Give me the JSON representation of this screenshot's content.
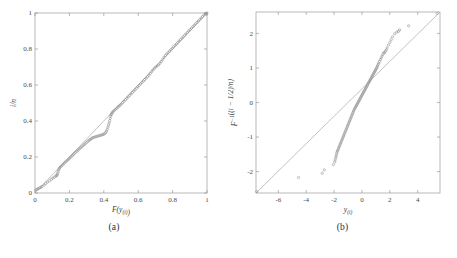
{
  "figure": {
    "background": "#ffffff",
    "line_color": "#a8a8a8",
    "marker_color": "#8c8c8c",
    "text_color": "#3a3a3a"
  },
  "panels": [
    {
      "caption": "(a)",
      "xlabel": "F(y(i))",
      "ylabel": "i/n"
    },
    {
      "caption": "(b)",
      "xlabel": "y(i)",
      "ylabel": "F −1((i − 1/2)/n)"
    }
  ],
  "chart_data": [
    {
      "type": "scatter",
      "title": "",
      "subtitle": "",
      "panel": "(a)",
      "xlabel": "F(y(i))",
      "ylabel": "i/n",
      "xlim": [
        0,
        1
      ],
      "ylim": [
        0,
        1
      ],
      "xticks": [
        0,
        0.2,
        0.4,
        0.6,
        0.8,
        1
      ],
      "xticklabels": [
        "0",
        "0.2",
        "0.4",
        "0.6",
        "0.8",
        "1"
      ],
      "yticks": [
        0,
        0.2,
        0.4,
        0.6,
        0.8,
        1
      ],
      "yticklabels": [
        "0",
        "0.2",
        "0.4",
        "0.6",
        "0.8",
        "1"
      ],
      "grid": false,
      "legend": null,
      "reference_line": {
        "from": [
          0,
          0
        ],
        "to": [
          1,
          1
        ],
        "style": "solid"
      },
      "marker": "open-circle",
      "series": [
        {
          "name": "empirical cdf vs theoretical cdf",
          "x": [
            0.005,
            0.012,
            0.018,
            0.026,
            0.034,
            0.041,
            0.052,
            0.062,
            0.072,
            0.084,
            0.095,
            0.104,
            0.113,
            0.121,
            0.126,
            0.129,
            0.131,
            0.134,
            0.138,
            0.141,
            0.145,
            0.151,
            0.158,
            0.164,
            0.17,
            0.177,
            0.184,
            0.191,
            0.197,
            0.203,
            0.21,
            0.217,
            0.223,
            0.229,
            0.236,
            0.243,
            0.25,
            0.257,
            0.264,
            0.271,
            0.278,
            0.285,
            0.292,
            0.299,
            0.306,
            0.313,
            0.319,
            0.325,
            0.331,
            0.337,
            0.344,
            0.351,
            0.358,
            0.365,
            0.372,
            0.379,
            0.386,
            0.393,
            0.399,
            0.405,
            0.411,
            0.416,
            0.42,
            0.424,
            0.428,
            0.431,
            0.434,
            0.437,
            0.44,
            0.442,
            0.445,
            0.449,
            0.454,
            0.46,
            0.467,
            0.474,
            0.481,
            0.488,
            0.495,
            0.502,
            0.51,
            0.518,
            0.526,
            0.534,
            0.542,
            0.55,
            0.558,
            0.566,
            0.574,
            0.582,
            0.59,
            0.598,
            0.606,
            0.614,
            0.622,
            0.63,
            0.638,
            0.646,
            0.654,
            0.662,
            0.67,
            0.678,
            0.686,
            0.694,
            0.702,
            0.71,
            0.718,
            0.726,
            0.734,
            0.742,
            0.75,
            0.758,
            0.766,
            0.774,
            0.782,
            0.79,
            0.798,
            0.806,
            0.814,
            0.822,
            0.83,
            0.838,
            0.846,
            0.854,
            0.862,
            0.87,
            0.878,
            0.886,
            0.894,
            0.902,
            0.91,
            0.918,
            0.926,
            0.934,
            0.942,
            0.95,
            0.958,
            0.966,
            0.974,
            0.982,
            0.99,
            0.996,
            1.0
          ],
          "y": [
            0.018,
            0.021,
            0.024,
            0.028,
            0.032,
            0.036,
            0.044,
            0.052,
            0.06,
            0.068,
            0.076,
            0.082,
            0.088,
            0.093,
            0.097,
            0.101,
            0.108,
            0.118,
            0.128,
            0.136,
            0.142,
            0.148,
            0.154,
            0.16,
            0.166,
            0.172,
            0.178,
            0.184,
            0.19,
            0.196,
            0.202,
            0.208,
            0.214,
            0.22,
            0.226,
            0.232,
            0.238,
            0.244,
            0.25,
            0.256,
            0.262,
            0.268,
            0.274,
            0.28,
            0.286,
            0.292,
            0.296,
            0.3,
            0.304,
            0.308,
            0.31,
            0.312,
            0.314,
            0.316,
            0.318,
            0.32,
            0.322,
            0.324,
            0.326,
            0.33,
            0.336,
            0.344,
            0.354,
            0.366,
            0.378,
            0.39,
            0.402,
            0.414,
            0.426,
            0.434,
            0.44,
            0.446,
            0.452,
            0.458,
            0.464,
            0.47,
            0.476,
            0.482,
            0.488,
            0.494,
            0.502,
            0.51,
            0.518,
            0.526,
            0.534,
            0.542,
            0.55,
            0.558,
            0.566,
            0.574,
            0.582,
            0.59,
            0.598,
            0.606,
            0.614,
            0.622,
            0.63,
            0.638,
            0.646,
            0.654,
            0.664,
            0.674,
            0.684,
            0.692,
            0.7,
            0.706,
            0.712,
            0.72,
            0.73,
            0.742,
            0.754,
            0.764,
            0.772,
            0.78,
            0.788,
            0.796,
            0.804,
            0.812,
            0.82,
            0.828,
            0.836,
            0.844,
            0.852,
            0.86,
            0.868,
            0.876,
            0.884,
            0.892,
            0.9,
            0.908,
            0.916,
            0.924,
            0.932,
            0.94,
            0.948,
            0.956,
            0.964,
            0.972,
            0.98,
            0.988,
            0.994,
            0.998,
            1.0
          ]
        }
      ]
    },
    {
      "type": "scatter",
      "title": "",
      "subtitle": "",
      "panel": "(b)",
      "xlabel": "y(i)",
      "ylabel": "F −1((i − 1/2)/n)",
      "xlim": [
        -7.6,
        5.6
      ],
      "ylim": [
        -2.62,
        2.62
      ],
      "xticks": [
        -6,
        -4,
        -2,
        0,
        2,
        4
      ],
      "xticklabels": [
        "-6",
        "-4",
        "-2",
        "0",
        "2",
        "4"
      ],
      "yticks": [
        -2,
        -1,
        0,
        1,
        2
      ],
      "yticklabels": [
        "-2",
        "-1",
        "0",
        "1",
        "2"
      ],
      "grid": false,
      "legend": null,
      "reference_line": {
        "from": [
          -7.6,
          -2.62
        ],
        "to": [
          5.6,
          2.62
        ],
        "style": "solid"
      },
      "marker": "open-circle",
      "series": [
        {
          "name": "normal quantile-quantile",
          "x": [
            -7.55,
            -4.55,
            -2.85,
            -2.7,
            -2.05,
            -1.95,
            -1.92,
            -1.88,
            -1.85,
            -1.82,
            -1.8,
            -1.76,
            -1.72,
            -1.68,
            -1.64,
            -1.6,
            -1.56,
            -1.52,
            -1.48,
            -1.44,
            -1.4,
            -1.36,
            -1.32,
            -1.28,
            -1.24,
            -1.2,
            -1.16,
            -1.12,
            -1.08,
            -1.04,
            -1.0,
            -0.96,
            -0.92,
            -0.88,
            -0.84,
            -0.8,
            -0.76,
            -0.72,
            -0.68,
            -0.64,
            -0.6,
            -0.56,
            -0.52,
            -0.48,
            -0.44,
            -0.4,
            -0.36,
            -0.32,
            -0.28,
            -0.24,
            -0.2,
            -0.16,
            -0.12,
            -0.08,
            -0.04,
            0.0,
            0.04,
            0.08,
            0.12,
            0.16,
            0.2,
            0.24,
            0.28,
            0.32,
            0.36,
            0.4,
            0.44,
            0.48,
            0.52,
            0.56,
            0.6,
            0.64,
            0.68,
            0.72,
            0.76,
            0.8,
            0.84,
            0.88,
            0.92,
            0.96,
            1.0,
            1.04,
            1.08,
            1.12,
            1.16,
            1.2,
            1.26,
            1.32,
            1.38,
            1.44,
            1.5,
            1.56,
            1.62,
            1.68,
            1.74,
            1.8,
            1.9,
            2.0,
            2.1,
            2.2,
            2.35,
            2.5,
            2.62,
            2.7,
            3.35,
            5.4
          ],
          "y": [
            -2.58,
            -2.17,
            -2.05,
            -1.95,
            -1.8,
            -1.72,
            -1.66,
            -1.6,
            -1.55,
            -1.5,
            -1.45,
            -1.41,
            -1.37,
            -1.33,
            -1.29,
            -1.25,
            -1.21,
            -1.17,
            -1.13,
            -1.09,
            -1.05,
            -1.01,
            -0.97,
            -0.93,
            -0.89,
            -0.85,
            -0.81,
            -0.77,
            -0.73,
            -0.69,
            -0.65,
            -0.61,
            -0.57,
            -0.53,
            -0.49,
            -0.45,
            -0.41,
            -0.37,
            -0.33,
            -0.29,
            -0.25,
            -0.21,
            -0.18,
            -0.15,
            -0.12,
            -0.09,
            -0.06,
            -0.03,
            0.0,
            0.03,
            0.06,
            0.09,
            0.12,
            0.15,
            0.18,
            0.21,
            0.24,
            0.27,
            0.3,
            0.33,
            0.36,
            0.39,
            0.42,
            0.45,
            0.48,
            0.51,
            0.54,
            0.57,
            0.6,
            0.63,
            0.66,
            0.69,
            0.72,
            0.75,
            0.78,
            0.81,
            0.84,
            0.87,
            0.9,
            0.93,
            0.96,
            0.99,
            1.02,
            1.06,
            1.1,
            1.14,
            1.19,
            1.24,
            1.29,
            1.34,
            1.39,
            1.44,
            1.44,
            1.48,
            1.52,
            1.58,
            1.66,
            1.74,
            1.82,
            1.9,
            1.99,
            2.04,
            2.06,
            2.1,
            2.22,
            2.58
          ]
        }
      ]
    }
  ]
}
